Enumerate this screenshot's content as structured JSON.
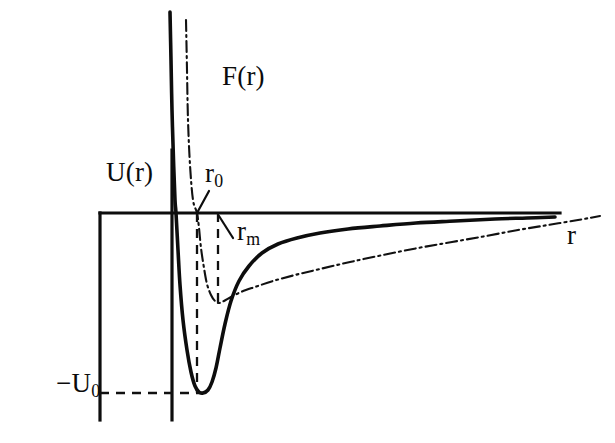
{
  "figure": {
    "background_color": "#ffffff",
    "ink_color": "#0d0d0d",
    "labels": {
      "potential_curve": "U(r)",
      "force_curve": "F(r)",
      "r_axis": "r",
      "r_zero_base": "r",
      "r_zero_sub": "0",
      "r_min_base": "r",
      "r_min_sub": "m",
      "well_depth_prefix": "−U",
      "well_depth_sub": "0"
    }
  },
  "chart_data": {
    "type": "line",
    "title": "",
    "xlabel": "r",
    "ylabel": "U(r)",
    "grid": false,
    "legend": "none",
    "annotations": [
      {
        "name": "r_0",
        "text": "r0",
        "meaning": "separation where U(r) crosses zero",
        "x_px": 197,
        "y_px": 213
      },
      {
        "name": "r_m",
        "text": "rm",
        "meaning": "separation of potential minimum and force extremum",
        "x_px": 218,
        "y_px": 213
      },
      {
        "name": "-U_0",
        "text": "-U0",
        "meaning": "depth of the potential well",
        "x_px": 100,
        "y_px": 393
      },
      {
        "name": "U(r)",
        "text": "U(r)",
        "meaning": "interaction potential energy curve"
      },
      {
        "name": "F(r)",
        "text": "F(r)",
        "meaning": "interaction force curve"
      },
      {
        "name": "r",
        "text": "r",
        "meaning": "interparticle separation axis"
      }
    ],
    "axes": {
      "horizontal_axis_y_px": 213,
      "horizontal_axis_x_start_px": 100,
      "horizontal_axis_x_end_px": 560,
      "vertical_axis_x_px": 172,
      "vertical_axis_y_start_px": 150,
      "vertical_axis_y_end_px": 420
    },
    "series": [
      {
        "name": "U(r)",
        "style": "solid",
        "points_px": [
          [
            170,
            12
          ],
          [
            171,
            60
          ],
          [
            172,
            110
          ],
          [
            173.5,
            160
          ],
          [
            175,
            200
          ],
          [
            176,
            213
          ],
          [
            178,
            250
          ],
          [
            180,
            285
          ],
          [
            183,
            320
          ],
          [
            187,
            350
          ],
          [
            191,
            372
          ],
          [
            195,
            386
          ],
          [
            199,
            392
          ],
          [
            203,
            393
          ],
          [
            208,
            390
          ],
          [
            212,
            382
          ],
          [
            216,
            368
          ],
          [
            220,
            348
          ],
          [
            225,
            324
          ],
          [
            231,
            301
          ],
          [
            239,
            281
          ],
          [
            249,
            266
          ],
          [
            262,
            253
          ],
          [
            278,
            244
          ],
          [
            297,
            238
          ],
          [
            320,
            233
          ],
          [
            348,
            229
          ],
          [
            380,
            226
          ],
          [
            416,
            223
          ],
          [
            455,
            221
          ],
          [
            495,
            219
          ],
          [
            527,
            218
          ],
          [
            555,
            217
          ]
        ]
      },
      {
        "name": "F(r)",
        "style": "dash-dot",
        "points_px": [
          [
            186,
            20
          ],
          [
            187,
            70
          ],
          [
            188,
            120
          ],
          [
            190,
            165
          ],
          [
            193,
            200
          ],
          [
            197,
            213
          ],
          [
            199,
            228
          ],
          [
            201,
            248
          ],
          [
            204,
            268
          ],
          [
            207,
            284
          ],
          [
            211,
            295
          ],
          [
            215,
            301
          ],
          [
            219,
            303
          ],
          [
            224,
            301
          ],
          [
            231,
            297
          ],
          [
            241,
            292
          ],
          [
            255,
            287
          ],
          [
            273,
            281
          ],
          [
            295,
            275
          ],
          [
            320,
            269
          ],
          [
            350,
            262
          ],
          [
            383,
            255
          ],
          [
            418,
            248
          ],
          [
            452,
            242
          ],
          [
            486,
            236
          ],
          [
            518,
            230
          ],
          [
            548,
            225
          ],
          [
            578,
            220
          ],
          [
            600,
            216
          ]
        ]
      }
    ],
    "guides": [
      {
        "name": "r_0_vertical",
        "style": "dashed",
        "x1_px": 197,
        "y1_px": 213,
        "x2_px": 197,
        "y2_px": 393
      },
      {
        "name": "r_m_vertical",
        "style": "dashed",
        "x1_px": 218,
        "y1_px": 213,
        "x2_px": 218,
        "y2_px": 303
      },
      {
        "name": "well_depth_horizontal",
        "style": "dashed",
        "x1_px": 100,
        "y1_px": 393,
        "x2_px": 203,
        "y2_px": 393
      }
    ],
    "leaders": [
      {
        "name": "r_0_leader",
        "x1_px": 209,
        "y1_px": 191,
        "x2_px": 197,
        "y2_px": 213
      },
      {
        "name": "r_m_leader",
        "x1_px": 233,
        "y1_px": 238,
        "x2_px": 219,
        "y2_px": 216
      }
    ]
  }
}
